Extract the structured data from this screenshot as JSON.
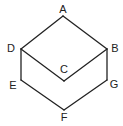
{
  "diagram": {
    "title": "",
    "vertices": [
      {
        "id": "A",
        "label": "A"
      },
      {
        "id": "B",
        "label": "B"
      },
      {
        "id": "C",
        "label": "C"
      },
      {
        "id": "D",
        "label": "D"
      },
      {
        "id": "E",
        "label": "E"
      },
      {
        "id": "F",
        "label": "F"
      },
      {
        "id": "G",
        "label": "G"
      }
    ],
    "edges": [
      [
        "A",
        "B"
      ],
      [
        "A",
        "D"
      ],
      [
        "D",
        "C"
      ],
      [
        "C",
        "B"
      ],
      [
        "D",
        "E"
      ],
      [
        "E",
        "F"
      ],
      [
        "F",
        "G"
      ],
      [
        "G",
        "B"
      ]
    ],
    "colors": {
      "line": "#222222",
      "background": "#ffffff"
    }
  }
}
